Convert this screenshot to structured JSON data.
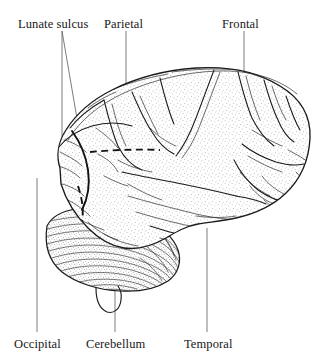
{
  "figure": {
    "background_color": "#ffffff",
    "ink_color": "#1b1b1b",
    "leader_color": "#5a5a5a",
    "view": "left lateral",
    "orientation": "occipital pole at left, frontal pole at right"
  },
  "labels": {
    "lunate_sulcus": {
      "text": "Lunate sulcus",
      "position": "top-left",
      "x": 18,
      "y": 28,
      "leader_count": 2
    },
    "parietal": {
      "text": "Parietal",
      "position": "top-center",
      "x": 104,
      "y": 28,
      "leader_count": 1
    },
    "frontal": {
      "text": "Frontal",
      "position": "top-right",
      "x": 222,
      "y": 28,
      "leader_count": 1
    },
    "occipital": {
      "text": "Occipital",
      "position": "bottom-left",
      "x": 14,
      "y": 348,
      "leader_count": 1
    },
    "cerebellum": {
      "text": "Cerebellum",
      "position": "bottom-center",
      "x": 86,
      "y": 348,
      "leader_count": 1
    },
    "temporal": {
      "text": "Temporal",
      "position": "bottom-right",
      "x": 184,
      "y": 348,
      "leader_count": 1
    }
  },
  "structures": {
    "cerebrum": "cerebral hemisphere with gyri and sulci, stippled shading",
    "cerebellum": "cerebellum with fine parallel folia, lower left",
    "brainstem": "brainstem stub below cerebellum",
    "lunate_sulcus_marking": "dashed line marking the lunate sulcus boundary",
    "central_sulcus": "central sulcus running down from vertex",
    "lateral_fissure": "lateral (Sylvian) fissure above temporal lobe"
  }
}
